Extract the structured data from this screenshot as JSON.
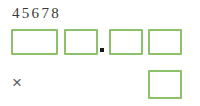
{
  "worksheet": {
    "number_line": {
      "text": "45678",
      "digits": [
        "4",
        "5",
        "6",
        "7",
        "8"
      ]
    },
    "answer_row": {
      "boxes": [
        {
          "name": "answer-box-1",
          "value": "",
          "placeholder": ""
        },
        {
          "name": "answer-box-2",
          "value": "",
          "placeholder": ""
        },
        {
          "name": "answer-box-3",
          "value": "",
          "placeholder": ""
        },
        {
          "name": "answer-box-4",
          "value": "",
          "placeholder": ""
        }
      ],
      "decimal_separator": "."
    },
    "operator_row": {
      "operator": "×",
      "boxes": [
        {
          "name": "operand-box-1",
          "value": "",
          "placeholder": ""
        }
      ]
    },
    "colors": {
      "box_border": "#8cc06a",
      "box_fill": "#ffffff",
      "digit_text": "#3a3a3a",
      "operator_text": "#5d5d5d",
      "decimal_point": "#1a1a1a",
      "background": "#ffffff"
    }
  }
}
